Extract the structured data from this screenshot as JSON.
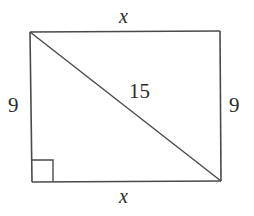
{
  "diagram": {
    "type": "rectangle-with-diagonal",
    "vertices": {
      "top_left": [
        30,
        32
      ],
      "top_right": [
        220,
        31
      ],
      "bottom_right": [
        221,
        181
      ],
      "bottom_left": [
        32,
        182
      ]
    },
    "diagonal": {
      "from": "top_left",
      "to": "bottom_right",
      "label": "15"
    },
    "right_angle_marker": {
      "corner": "bottom_left",
      "size": 21
    },
    "labels": {
      "top_side": "x",
      "bottom_side": "x",
      "left_side": "9",
      "right_side": "9",
      "diagonal": "15"
    },
    "colors": {
      "line": "#4a4a4a",
      "text": "#2a2a2a",
      "background": "#ffffff"
    }
  }
}
